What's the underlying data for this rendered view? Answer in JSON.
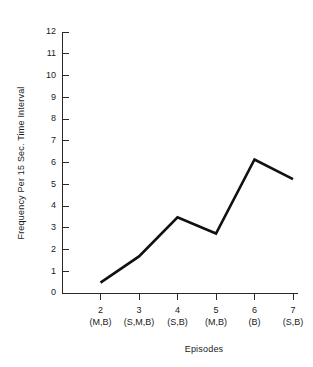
{
  "chart_data": {
    "type": "line",
    "title": "",
    "xlabel": "Episodes",
    "ylabel": "Frequency Per 15 Sec. Time Interval",
    "categories": [
      "2",
      "3",
      "4",
      "5",
      "6",
      "7"
    ],
    "category_sublabels": [
      "(M,B)",
      "(S,M,B)",
      "(S,B)",
      "(M,B)",
      "(B)",
      "(S,B)"
    ],
    "x": [
      2,
      3,
      4,
      5,
      6,
      7
    ],
    "values": [
      0.5,
      1.7,
      3.5,
      2.75,
      6.15,
      5.25
    ],
    "series": [
      {
        "name": "Frequency",
        "values": [
          0.5,
          1.7,
          3.5,
          2.75,
          6.15,
          5.25
        ]
      }
    ],
    "ylim": [
      0,
      12
    ],
    "xlim": [
      2,
      7
    ],
    "yticks": [
      0,
      1,
      2,
      3,
      4,
      5,
      6,
      7,
      8,
      9,
      10,
      11,
      12
    ],
    "ytick_labels": [
      "0",
      "1",
      "2",
      "3",
      "4",
      "5",
      "6",
      "7",
      "8",
      "9",
      "10",
      "11",
      "12"
    ],
    "grid": false,
    "legend": false,
    "legend_position": "none",
    "line_color": "#111111",
    "axis_color": "#2a2a2a",
    "background_color": "#ffffff"
  }
}
